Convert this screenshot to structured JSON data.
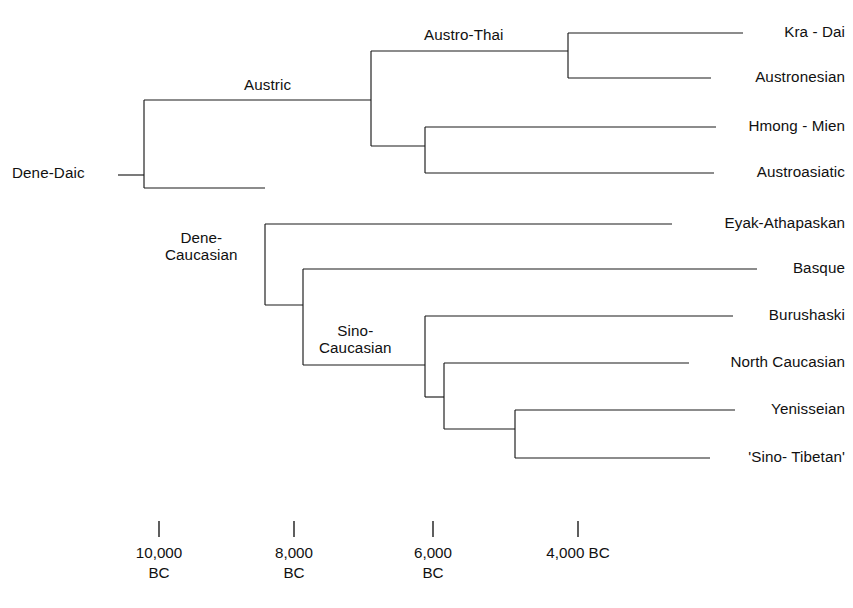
{
  "chart_data": {
    "type": "tree",
    "title": "",
    "xlabel": "",
    "ylabel": "",
    "root": {
      "name": "Dene-Daic",
      "date": "10,500 BC"
    },
    "leaves": [
      {
        "id": "kra-dai",
        "label": "Kra - Dai",
        "y": 33,
        "branch_start_x": 568,
        "branch_end_x": 743
      },
      {
        "id": "austronesian",
        "label": "Austronesian",
        "y": 78,
        "branch_start_x": 568,
        "branch_end_x": 711
      },
      {
        "id": "hmong-mien",
        "label": "Hmong - Mien",
        "y": 127,
        "branch_start_x": 425,
        "branch_end_x": 716
      },
      {
        "id": "austroasiatic",
        "label": "Austroasiatic",
        "y": 173,
        "branch_start_x": 425,
        "branch_end_x": 714
      },
      {
        "id": "eyak-athapaskan",
        "label": "Eyak-Athapaskan",
        "y": 224,
        "branch_start_x": 265,
        "branch_end_x": 672
      },
      {
        "id": "basque",
        "label": "Basque",
        "y": 269,
        "branch_start_x": 303,
        "branch_end_x": 757
      },
      {
        "id": "burushaski",
        "label": "Burushaski",
        "y": 316,
        "branch_start_x": 425,
        "branch_end_x": 733
      },
      {
        "id": "north-caucasian",
        "label": "North Caucasian",
        "y": 363,
        "branch_start_x": 444,
        "branch_end_x": 689
      },
      {
        "id": "yenisseian",
        "label": "Yenisseian",
        "y": 410,
        "branch_start_x": 515,
        "branch_end_x": 735
      },
      {
        "id": "sino-tibetan",
        "label": "'Sino- Tibetan'",
        "y": 458,
        "branch_start_x": 515,
        "branch_end_x": 710
      }
    ],
    "internal_nodes": [
      {
        "id": "dene-daic",
        "label": "Dene-Daic",
        "x": 144,
        "y_top": 100,
        "y_bottom": 188,
        "parent_x": 118,
        "y": 175
      },
      {
        "id": "austric",
        "label": "Austric",
        "x": 371,
        "y_top": 51,
        "y_bottom": 146,
        "parent_x": 144,
        "y": 100
      },
      {
        "id": "austro-thai",
        "label": "Austro-Thai",
        "x": 568,
        "y_top": 33,
        "y_bottom": 78,
        "parent_x": 371,
        "y": 51
      },
      {
        "id": "hm-aa",
        "label": "",
        "x": 425,
        "y_top": 127,
        "y_bottom": 173,
        "parent_x": 371,
        "y": 146
      },
      {
        "id": "dene-caucasian",
        "label": "Dene-\nCaucasian",
        "x": 265,
        "y_top": 224,
        "y_bottom": 305,
        "parent_x": 144,
        "y": 188
      },
      {
        "id": "basque-sino",
        "label": "",
        "x": 303,
        "y_top": 269,
        "y_bottom": 365,
        "parent_x": 265,
        "y": 305
      },
      {
        "id": "sino-caucasian",
        "label": "Sino-\nCaucasian",
        "x": 425,
        "y_top": 316,
        "y_bottom": 397,
        "parent_x": 303,
        "y": 365
      },
      {
        "id": "nc-yen-st",
        "label": "",
        "x": 444,
        "y_top": 363,
        "y_bottom": 429,
        "parent_x": 425,
        "y": 397
      },
      {
        "id": "yen-st",
        "label": "",
        "x": 515,
        "y_top": 410,
        "y_bottom": 458,
        "parent_x": 444,
        "y": 429
      }
    ],
    "node_labels": [
      {
        "id": "austric-label",
        "text": "Austric",
        "x": 244,
        "y": 76,
        "mode": "single"
      },
      {
        "id": "austro-thai-label",
        "text": "Austro-Thai",
        "x": 424,
        "y": 26,
        "mode": "single"
      },
      {
        "id": "dene-caucasian-label",
        "line1": "Dene-",
        "line2": "Caucasian",
        "x": 165,
        "y": 229,
        "mode": "two-line"
      },
      {
        "id": "sino-caucasian-label",
        "line1": "Sino-",
        "line2": "Caucasian",
        "x": 319,
        "y": 322,
        "mode": "two-line"
      }
    ],
    "root_label": {
      "text": "Dene-Daic",
      "x": 12,
      "y": 164,
      "stem_from_x": 118,
      "stem_to_x": 144,
      "stem_y": 175
    },
    "axis": {
      "tick_y_top": 521,
      "tick_y_bottom": 537,
      "label_y": 543,
      "ticks": [
        {
          "x": 159,
          "line1": "10,000",
          "line2": "BC"
        },
        {
          "x": 294,
          "line1": "8,000",
          "line2": "BC"
        },
        {
          "x": 433,
          "line1": "6,000",
          "line2": "BC"
        },
        {
          "x": 578,
          "line1": "4,000 BC",
          "line2": ""
        }
      ],
      "scale_note": "approximately 140 px per 2000 years, dates BC decreasing to the right"
    },
    "colors": {
      "line": "#1a1a1a",
      "text": "#111111",
      "background": "#ffffff"
    }
  }
}
